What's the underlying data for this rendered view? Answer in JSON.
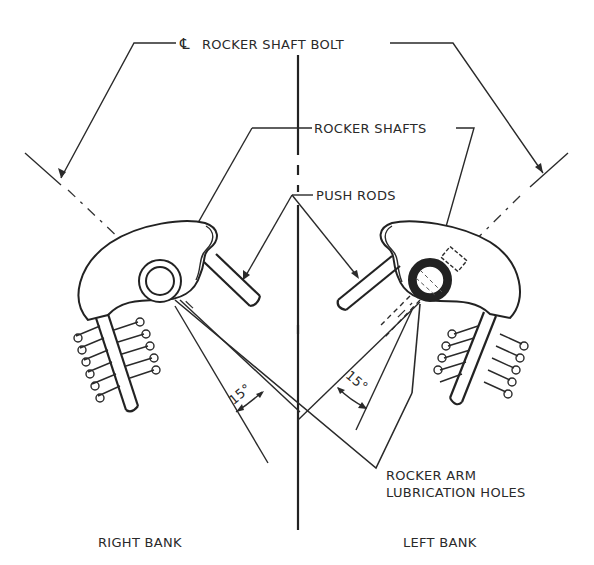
{
  "diagram": {
    "labels": {
      "rocker_shaft_bolt": "ROCKER SHAFT BOLT",
      "centerline_symbol": "℄",
      "rocker_shafts": "ROCKER SHAFTS",
      "push_rods": "PUSH RODS",
      "rocker_arm_line1": "ROCKER ARM",
      "rocker_arm_line2": "LUBRICATION HOLES",
      "angle_right": "15°",
      "angle_left": "15°",
      "right_bank": "RIGHT BANK",
      "left_bank": "LEFT BANK"
    },
    "colors": {
      "ink": "#2a2a2a",
      "background": "#ffffff"
    }
  }
}
